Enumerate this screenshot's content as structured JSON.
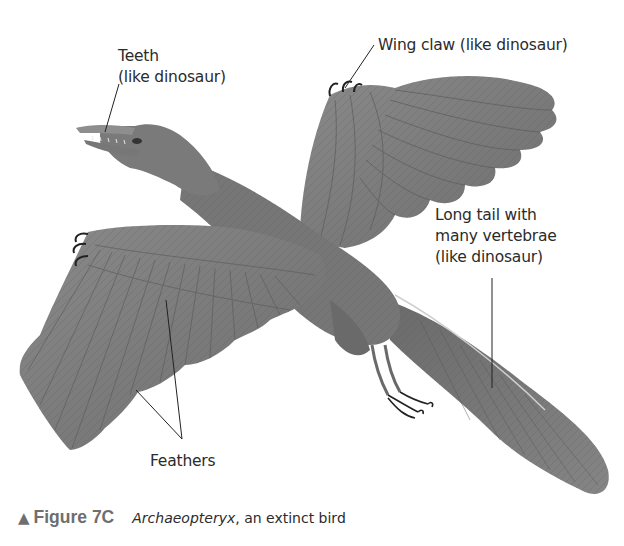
{
  "figure": {
    "labels": {
      "teeth": [
        "Teeth",
        "(like dinosaur)"
      ],
      "wing_claw": "Wing claw (like dinosaur)",
      "long_tail": [
        "Long tail with",
        "many vertebrae",
        "(like dinosaur)"
      ],
      "feathers": "Feathers"
    },
    "caption": {
      "marker": "▲",
      "number": "Figure 7C",
      "italic": "Archaeopteryx",
      "rest": ", an extinct bird"
    },
    "colors": {
      "background": "#ffffff",
      "bird_gray": "#7d7d7d",
      "bird_dark": "#5a5a5a",
      "bird_light": "#a3a3a3",
      "text": "#2b2b2b",
      "caption_gray": "#6e6e6e",
      "leader_line": "#222222"
    }
  }
}
